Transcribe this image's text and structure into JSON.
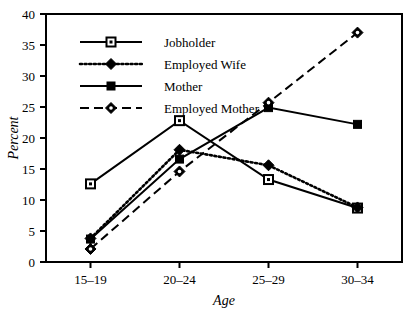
{
  "chart_data": {
    "type": "line",
    "title": "",
    "subtitle": "",
    "xlabel": "Age",
    "ylabel": "Percent",
    "categories": [
      "15–19",
      "20–24",
      "25–29",
      "30–34"
    ],
    "xtick_labels": [
      "15–19",
      "20–24",
      "25–29",
      "30–34"
    ],
    "ytick_labels": [
      "0",
      "5",
      "10",
      "15",
      "20",
      "25",
      "30",
      "35",
      "40"
    ],
    "ytick_values": [
      0,
      5,
      10,
      15,
      20,
      25,
      30,
      35,
      40
    ],
    "ylim": [
      0,
      40
    ],
    "grid": false,
    "legend_position": "top-left-inside",
    "series": [
      {
        "name": "Jobholder",
        "values": [
          12.6,
          22.8,
          13.3,
          8.7
        ],
        "line_style": "solid",
        "marker": "open-square",
        "color": "#000000"
      },
      {
        "name": "Employed Wife",
        "values": [
          3.8,
          18.1,
          15.6,
          8.8
        ],
        "line_style": "dotted",
        "marker": "filled-diamond",
        "color": "#000000"
      },
      {
        "name": "Mother",
        "values": [
          3.7,
          16.6,
          24.9,
          22.2
        ],
        "line_style": "solid",
        "marker": "filled-square",
        "color": "#000000"
      },
      {
        "name": "Employed Mother",
        "values": [
          2.1,
          14.6,
          25.7,
          37.0
        ],
        "line_style": "dashed",
        "marker": "holed-diamond",
        "color": "#000000"
      }
    ]
  },
  "legend": {
    "entries": [
      {
        "label": "Jobholder"
      },
      {
        "label": "Employed Wife"
      },
      {
        "label": "Mother"
      },
      {
        "label": "Employed Mother"
      }
    ]
  },
  "axes": {
    "y_title": "Percent",
    "x_title": "Age"
  }
}
